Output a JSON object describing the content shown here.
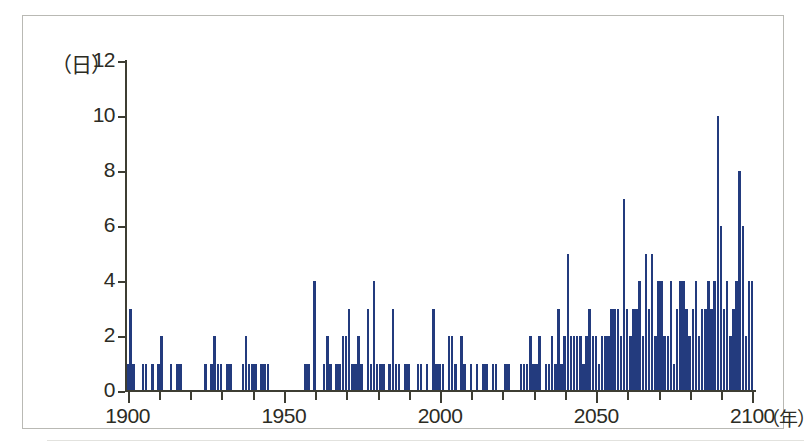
{
  "figure": {
    "background_color": "#ffffff",
    "frame_color": "#b9b9b4",
    "axis_color": "#3d3d33"
  },
  "axes": {
    "y_unit_label": "（日）",
    "x_unit_label": "（年）",
    "y_tick_labels": [
      "0",
      "2",
      "4",
      "6",
      "8",
      "10",
      "12"
    ],
    "x_tick_labels": [
      "1900",
      "1950",
      "2000",
      "2050",
      "2100"
    ]
  },
  "chart_data": {
    "type": "bar",
    "title": "",
    "subtitle": "",
    "xlabel": "（年）",
    "ylabel": "（日）",
    "xlim": [
      1900,
      2100
    ],
    "ylim": [
      0,
      12
    ],
    "y_ticks": [
      0,
      2,
      4,
      6,
      8,
      10,
      12
    ],
    "x_ticks": [
      1900,
      1950,
      2000,
      2050,
      2100
    ],
    "x_minor_tick_interval": 10,
    "grid": false,
    "legend": null,
    "bar_color": "#233b7e",
    "series": [
      {
        "name": "日数",
        "x": [
          1900,
          1901,
          1902,
          1903,
          1904,
          1905,
          1906,
          1907,
          1908,
          1909,
          1910,
          1911,
          1912,
          1913,
          1914,
          1915,
          1916,
          1917,
          1918,
          1919,
          1920,
          1921,
          1922,
          1923,
          1924,
          1925,
          1926,
          1927,
          1928,
          1929,
          1930,
          1931,
          1932,
          1933,
          1934,
          1935,
          1936,
          1937,
          1938,
          1939,
          1940,
          1941,
          1942,
          1943,
          1944,
          1945,
          1946,
          1947,
          1948,
          1949,
          1950,
          1951,
          1952,
          1953,
          1954,
          1955,
          1956,
          1957,
          1958,
          1959,
          1960,
          1961,
          1962,
          1963,
          1964,
          1965,
          1966,
          1967,
          1968,
          1969,
          1970,
          1971,
          1972,
          1973,
          1974,
          1975,
          1976,
          1977,
          1978,
          1979,
          1980,
          1981,
          1982,
          1983,
          1984,
          1985,
          1986,
          1987,
          1988,
          1989,
          1990,
          1991,
          1992,
          1993,
          1994,
          1995,
          1996,
          1997,
          1998,
          1999,
          2000,
          2001,
          2002,
          2003,
          2004,
          2005,
          2006,
          2007,
          2008,
          2009,
          2010,
          2011,
          2012,
          2013,
          2014,
          2015,
          2016,
          2017,
          2018,
          2019,
          2020,
          2021,
          2022,
          2023,
          2024,
          2025,
          2026,
          2027,
          2028,
          2029,
          2030,
          2031,
          2032,
          2033,
          2034,
          2035,
          2036,
          2037,
          2038,
          2039,
          2040,
          2041,
          2042,
          2043,
          2044,
          2045,
          2046,
          2047,
          2048,
          2049,
          2050,
          2051,
          2052,
          2053,
          2054,
          2055,
          2056,
          2057,
          2058,
          2059,
          2060,
          2061,
          2062,
          2063,
          2064,
          2065,
          2066,
          2067,
          2068,
          2069,
          2070,
          2071,
          2072,
          2073,
          2074,
          2075,
          2076,
          2077,
          2078,
          2079,
          2080,
          2081,
          2082,
          2083,
          2084,
          2085,
          2086,
          2087,
          2088,
          2089,
          2090,
          2091,
          2092,
          2093,
          2094,
          2095,
          2096,
          2097,
          2098,
          2099,
          2100
        ],
        "values": [
          1,
          3,
          1,
          0,
          0,
          1,
          1,
          0,
          1,
          0,
          1,
          2,
          0,
          0,
          1,
          0,
          1,
          1,
          0,
          0,
          0,
          0,
          0,
          0,
          0,
          1,
          0,
          1,
          2,
          1,
          1,
          0,
          1,
          1,
          0,
          0,
          0,
          1,
          2,
          1,
          1,
          1,
          0,
          1,
          1,
          1,
          0,
          0,
          0,
          0,
          0,
          0,
          0,
          0,
          0,
          0,
          0,
          1,
          1,
          0,
          4,
          0,
          0,
          1,
          2,
          1,
          0,
          1,
          1,
          2,
          2,
          3,
          1,
          1,
          2,
          1,
          0,
          3,
          1,
          4,
          1,
          1,
          1,
          0,
          1,
          3,
          1,
          1,
          0,
          1,
          1,
          0,
          0,
          1,
          1,
          0,
          1,
          0,
          3,
          1,
          1,
          1,
          0,
          2,
          2,
          1,
          0,
          2,
          1,
          0,
          1,
          0,
          1,
          0,
          1,
          1,
          0,
          1,
          1,
          0,
          0,
          1,
          1,
          0,
          0,
          0,
          1,
          1,
          1,
          2,
          1,
          1,
          2,
          0,
          1,
          1,
          2,
          1,
          3,
          1,
          2,
          5,
          2,
          2,
          2,
          2,
          1,
          2,
          3,
          2,
          2,
          1,
          2,
          2,
          2,
          3,
          3,
          3,
          2,
          7,
          3,
          2,
          3,
          3,
          4,
          2,
          5,
          3,
          5,
          2,
          4,
          4,
          2,
          2,
          4,
          1,
          3,
          4,
          4,
          3,
          2,
          3,
          4,
          2,
          3,
          3,
          4,
          3,
          4,
          10,
          6,
          3,
          4,
          2,
          3,
          4,
          8,
          6,
          2,
          4,
          4
        ]
      }
    ]
  }
}
